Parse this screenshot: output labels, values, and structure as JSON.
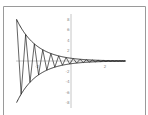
{
  "chart_data": {
    "type": "line",
    "title": "",
    "xlabel": "",
    "ylabel": "",
    "xlim": [
      -3.2,
      3.2
    ],
    "ylim": [
      -8,
      8
    ],
    "x_ticks": [
      {
        "value": -2,
        "label": "-2"
      },
      {
        "value": 2,
        "label": "2"
      }
    ],
    "y_ticks": [
      {
        "value": 8,
        "label": "8"
      },
      {
        "value": 6,
        "label": "6"
      },
      {
        "value": 4,
        "label": "4"
      },
      {
        "value": 2,
        "label": "2"
      },
      {
        "value": -2,
        "label": "-2"
      },
      {
        "value": -4,
        "label": "-4"
      },
      {
        "value": -6,
        "label": "-6"
      },
      {
        "value": -8,
        "label": "-8"
      }
    ],
    "grid": false,
    "legend": null,
    "series": [
      {
        "name": "upper envelope",
        "function": "y = 0.5*e^(-0.85x)",
        "x_range": [
          -3.2,
          3.2
        ]
      },
      {
        "name": "lower envelope",
        "function": "y = -0.5*e^(-0.85x)",
        "x_range": [
          -3.2,
          3.2
        ]
      },
      {
        "name": "damped oscillation",
        "function": "y = 0.5*e^(-0.85x)*cos(2*pi*x*3)",
        "x_range": [
          -3.2,
          3.2
        ],
        "style": "zigzag"
      }
    ],
    "params": {
      "amplitude_at_left": 8,
      "cycles_visible": 19
    }
  },
  "colors": {
    "curve": "#222222",
    "frame": "#9a9a9a",
    "axis": "#b8b8b8",
    "label": "#8a8a8a"
  }
}
